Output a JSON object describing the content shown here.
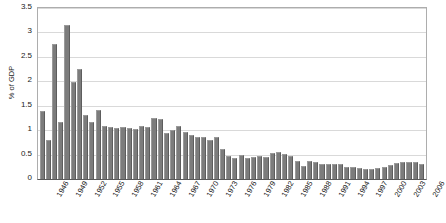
{
  "chart_data": {
    "type": "bar",
    "title": "",
    "xlabel": "",
    "ylabel": "% of GDP",
    "ylim": [
      0,
      3.5
    ],
    "ytick_labels": [
      "0",
      "0.5",
      "1",
      "1.5",
      "2",
      "2.5",
      "3",
      "3.5"
    ],
    "ytick_values": [
      0,
      0.5,
      1,
      1.5,
      2,
      2.5,
      3,
      3.5
    ],
    "grid": true,
    "legend": false,
    "bar_color": "#7c7c7c",
    "categories": [
      "1946",
      "1947",
      "1948",
      "1949",
      "1950",
      "1951",
      "1952",
      "1953",
      "1954",
      "1955",
      "1956",
      "1957",
      "1958",
      "1959",
      "1960",
      "1961",
      "1962",
      "1963",
      "1964",
      "1965",
      "1966",
      "1967",
      "1968",
      "1969",
      "1970",
      "1971",
      "1972",
      "1973",
      "1974",
      "1975",
      "1976",
      "1977",
      "1978",
      "1979",
      "1980",
      "1981",
      "1982",
      "1983",
      "1984",
      "1985",
      "1986",
      "1987",
      "1988",
      "1989",
      "1990",
      "1991",
      "1992",
      "1993",
      "1994",
      "1995",
      "1996",
      "1997",
      "1998",
      "1999",
      "2000",
      "2001",
      "2002",
      "2003",
      "2004",
      "2005",
      "2006",
      "2007"
    ],
    "values": [
      1.4,
      0.79,
      2.77,
      1.16,
      3.15,
      1.99,
      2.25,
      1.31,
      1.16,
      1.41,
      1.09,
      1.07,
      1.05,
      1.07,
      1.04,
      1.03,
      1.09,
      1.06,
      1.25,
      1.23,
      0.94,
      1.0,
      1.08,
      0.97,
      0.9,
      0.87,
      0.85,
      0.8,
      0.85,
      0.62,
      0.48,
      0.44,
      0.5,
      0.42,
      0.46,
      0.48,
      0.45,
      0.54,
      0.55,
      0.51,
      0.47,
      0.36,
      0.27,
      0.36,
      0.35,
      0.3,
      0.3,
      0.3,
      0.3,
      0.25,
      0.24,
      0.22,
      0.2,
      0.2,
      0.22,
      0.24,
      0.29,
      0.33,
      0.35,
      0.35,
      0.34,
      0.3
    ],
    "xtick_labels": [
      "1946",
      "1949",
      "1952",
      "1955",
      "1958",
      "1961",
      "1964",
      "1967",
      "1970",
      "1973",
      "1976",
      "1979",
      "1982",
      "1985",
      "1988",
      "1991",
      "1994",
      "1997",
      "2000",
      "2003",
      "2006"
    ],
    "xtick_indices": [
      0,
      3,
      6,
      9,
      12,
      15,
      18,
      21,
      24,
      27,
      30,
      33,
      36,
      39,
      42,
      45,
      48,
      51,
      54,
      57,
      60
    ]
  }
}
